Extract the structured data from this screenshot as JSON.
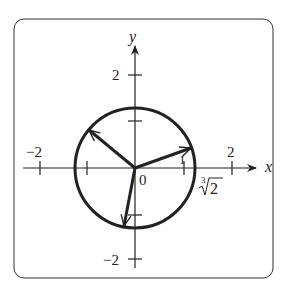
{
  "diagram": {
    "type": "complex-plane-roots",
    "axes": {
      "x_label": "x",
      "y_label": "y",
      "x_ticks": [
        {
          "value": -2,
          "label": "−2"
        },
        {
          "value": -1,
          "label": ""
        },
        {
          "value": 1,
          "label": "1"
        },
        {
          "value": 2,
          "label": "2"
        }
      ],
      "y_ticks": [
        {
          "value": 2,
          "label": "2"
        },
        {
          "value": 1,
          "label": ""
        },
        {
          "value": -1,
          "label": ""
        },
        {
          "value": -2,
          "label": "−2"
        }
      ],
      "origin_label": "0"
    },
    "circle": {
      "radius_label": "∛2",
      "radius_index": "3",
      "radius_radicand": "2",
      "radius": 1.26
    },
    "vectors": [
      {
        "name": "root-1",
        "angle_deg": 20
      },
      {
        "name": "root-2",
        "angle_deg": 140
      },
      {
        "name": "root-3",
        "angle_deg": 260
      }
    ]
  }
}
